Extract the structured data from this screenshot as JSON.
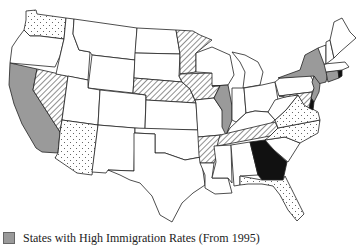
{
  "map": {
    "title": "United States immigration map",
    "fills": {
      "gray": "#9a9a9a",
      "black": "#111111",
      "white": "#ffffff",
      "hatch": "hatch",
      "dots": "dots"
    },
    "states": [
      {
        "id": "WA",
        "name": "Washington",
        "fill": "dots"
      },
      {
        "id": "OR",
        "name": "Oregon",
        "fill": "white"
      },
      {
        "id": "CA",
        "name": "California",
        "fill": "gray"
      },
      {
        "id": "NV",
        "name": "Nevada",
        "fill": "hatch"
      },
      {
        "id": "ID",
        "name": "Idaho",
        "fill": "white"
      },
      {
        "id": "MT",
        "name": "Montana",
        "fill": "white"
      },
      {
        "id": "WY",
        "name": "Wyoming",
        "fill": "white"
      },
      {
        "id": "UT",
        "name": "Utah",
        "fill": "white"
      },
      {
        "id": "AZ",
        "name": "Arizona",
        "fill": "dots"
      },
      {
        "id": "CO",
        "name": "Colorado",
        "fill": "white"
      },
      {
        "id": "NM",
        "name": "New Mexico",
        "fill": "white"
      },
      {
        "id": "ND",
        "name": "North Dakota",
        "fill": "white"
      },
      {
        "id": "SD",
        "name": "South Dakota",
        "fill": "white"
      },
      {
        "id": "NE",
        "name": "Nebraska",
        "fill": "hatch"
      },
      {
        "id": "KS",
        "name": "Kansas",
        "fill": "white"
      },
      {
        "id": "OK",
        "name": "Oklahoma",
        "fill": "white"
      },
      {
        "id": "TX",
        "name": "Texas",
        "fill": "white"
      },
      {
        "id": "MN",
        "name": "Minnesota",
        "fill": "hatch"
      },
      {
        "id": "IA",
        "name": "Iowa",
        "fill": "hatch"
      },
      {
        "id": "MO",
        "name": "Missouri",
        "fill": "white"
      },
      {
        "id": "AR",
        "name": "Arkansas",
        "fill": "hatch"
      },
      {
        "id": "LA",
        "name": "Louisiana",
        "fill": "white"
      },
      {
        "id": "WI",
        "name": "Wisconsin",
        "fill": "white"
      },
      {
        "id": "IL",
        "name": "Illinois",
        "fill": "gray"
      },
      {
        "id": "MI",
        "name": "Michigan",
        "fill": "white"
      },
      {
        "id": "IN",
        "name": "Indiana",
        "fill": "white"
      },
      {
        "id": "OH",
        "name": "Ohio",
        "fill": "white"
      },
      {
        "id": "KY",
        "name": "Kentucky",
        "fill": "white"
      },
      {
        "id": "TN",
        "name": "Tennessee",
        "fill": "hatch"
      },
      {
        "id": "MS",
        "name": "Mississippi",
        "fill": "white"
      },
      {
        "id": "AL",
        "name": "Alabama",
        "fill": "white"
      },
      {
        "id": "GA",
        "name": "Georgia",
        "fill": "black"
      },
      {
        "id": "FL",
        "name": "Florida",
        "fill": "dots"
      },
      {
        "id": "SC",
        "name": "South Carolina",
        "fill": "white"
      },
      {
        "id": "NC",
        "name": "North Carolina",
        "fill": "dots"
      },
      {
        "id": "VA",
        "name": "Virginia",
        "fill": "dots"
      },
      {
        "id": "WV",
        "name": "West Virginia",
        "fill": "white"
      },
      {
        "id": "PA",
        "name": "Pennsylvania",
        "fill": "white"
      },
      {
        "id": "NY",
        "name": "New York",
        "fill": "gray"
      },
      {
        "id": "NJ",
        "name": "New Jersey",
        "fill": "gray"
      },
      {
        "id": "DE",
        "name": "Delaware",
        "fill": "black"
      },
      {
        "id": "MD",
        "name": "Maryland",
        "fill": "hatch"
      },
      {
        "id": "CT",
        "name": "Connecticut",
        "fill": "gray"
      },
      {
        "id": "RI",
        "name": "Rhode Island",
        "fill": "black"
      },
      {
        "id": "MA",
        "name": "Massachusetts",
        "fill": "white"
      },
      {
        "id": "VT",
        "name": "Vermont",
        "fill": "white"
      },
      {
        "id": "NH",
        "name": "New Hampshire",
        "fill": "white"
      },
      {
        "id": "ME",
        "name": "Maine",
        "fill": "white"
      }
    ]
  },
  "legend": {
    "items": [
      {
        "swatch": "gray",
        "label": "States with High Immigration Rates (From 1995)"
      }
    ]
  }
}
